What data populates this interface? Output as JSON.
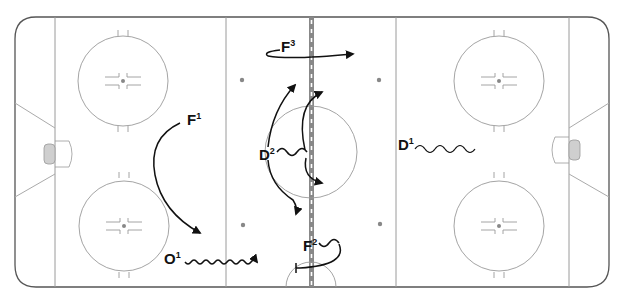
{
  "diagram": {
    "type": "hockey-rink-drill",
    "colors": {
      "boards": "#555555",
      "lines": "#9a9a9a",
      "center_line": "#888888",
      "faceoff_dot": "#888888",
      "goal_crease_fill": "#cfcfcf",
      "paths": "#111111"
    },
    "players": [
      {
        "id": "F1",
        "letter": "F",
        "number": "1",
        "role": "forward"
      },
      {
        "id": "F2",
        "letter": "F",
        "number": "2",
        "role": "forward"
      },
      {
        "id": "F3",
        "letter": "F",
        "number": "3",
        "role": "forward"
      },
      {
        "id": "D1",
        "letter": "D",
        "number": "1",
        "role": "defense"
      },
      {
        "id": "D2",
        "letter": "D",
        "number": "2",
        "role": "defense"
      },
      {
        "id": "O1",
        "letter": "O",
        "number": "1",
        "role": "opponent"
      }
    ],
    "paths": [
      {
        "player": "F1",
        "style": "skate-arrow",
        "description": "curves from top of left zone down to near blue line bottom"
      },
      {
        "player": "F3",
        "style": "skate-arrow",
        "description": "loops left then skates right across center line"
      },
      {
        "player": "D2",
        "style": "skate-arrow-multi",
        "description": "backward skating wave then options up and down across center"
      },
      {
        "player": "F2",
        "style": "skate-arrow-loop",
        "description": "wave then curls back to left along bottom"
      },
      {
        "player": "D1",
        "style": "backward-skating-wave",
        "description": "backward skating wave to the right"
      },
      {
        "player": "O1",
        "style": "puck-carry-wave",
        "description": "wavy line to the right toward neutral zone"
      }
    ]
  }
}
